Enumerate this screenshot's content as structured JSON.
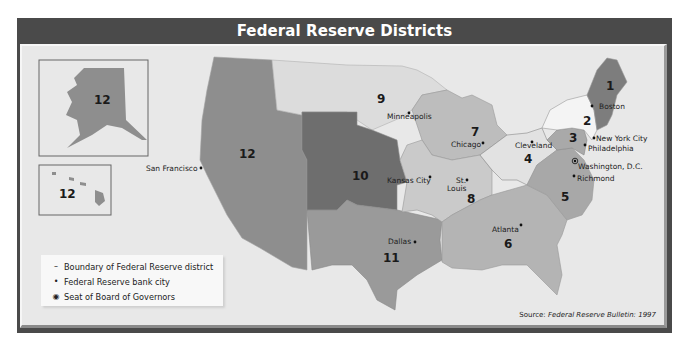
{
  "header": {
    "title": "Federal Reserve Districts"
  },
  "districts": {
    "d1": "1",
    "d2": "2",
    "d3": "3",
    "d4": "4",
    "d5": "5",
    "d6": "6",
    "d7": "7",
    "d8": "8",
    "d9": "9",
    "d10": "10",
    "d11": "11",
    "d12": "12",
    "alaska": "12",
    "hawaii": "12"
  },
  "cities": {
    "boston": "Boston",
    "new_york": "New York City",
    "philadelphia": "Philadelphia",
    "washington": "Washington, D.C.",
    "richmond": "Richmond",
    "cleveland": "Cleveland",
    "chicago": "Chicago",
    "minneapolis": "Minneapolis",
    "kansas_city": "Kansas City",
    "st_louis_1": "St.",
    "st_louis_2": "Louis",
    "atlanta": "Atlanta",
    "dallas": "Dallas",
    "san_francisco": "San Francisco"
  },
  "legend": {
    "items": [
      {
        "symbol": "–",
        "label": "Boundary of Federal Reserve district"
      },
      {
        "symbol": "•",
        "label": "Federal Reserve bank city"
      },
      {
        "symbol": "◉",
        "label": "Seat of Board of Governors"
      }
    ]
  },
  "source": {
    "prefix": "Source: ",
    "title": "Federal Reserve Bulletin: 1997"
  },
  "colors": {
    "frame": "#4a4a4a",
    "background": "#e8e8e8",
    "d1": "#7d7d7d",
    "d2": "#f4f4f4",
    "d3": "#a9a9a9",
    "d4": "#e2e2e2",
    "d5": "#a8a8a8",
    "d6": "#b4b4b4",
    "d7": "#bdbdbd",
    "d8": "#cacaca",
    "d9": "#dcdcdc",
    "d10": "#6e6e6e",
    "d11": "#9a9a9a",
    "d12": "#8e8e8e"
  }
}
